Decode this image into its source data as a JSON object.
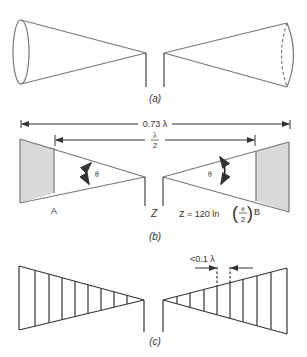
{
  "figure": {
    "panels": [
      {
        "id": "a",
        "caption": "(a)",
        "description": "Biconical antenna with circular cone ends"
      },
      {
        "id": "b",
        "caption": "(b)",
        "description": "Bowtie/biconical cross-section with dimensions",
        "dimension_total": "0.73 λ",
        "dimension_half_num": "λ",
        "dimension_half_den": "2",
        "angle_label_left": "θ",
        "angle_label_right": "θ",
        "point_a": "A",
        "point_b": "B",
        "feed_label": "Z",
        "formula_prefix": "Z = 120 ln",
        "formula_frac_num": "θ",
        "formula_frac_den": "2"
      },
      {
        "id": "c",
        "caption": "(c)",
        "description": "Wire-grid bowtie antenna",
        "spacing_label": "<0.1 λ"
      }
    ],
    "colors": {
      "line": "#555555",
      "dark_line": "#333333",
      "shade": "#d9d9d9"
    }
  }
}
